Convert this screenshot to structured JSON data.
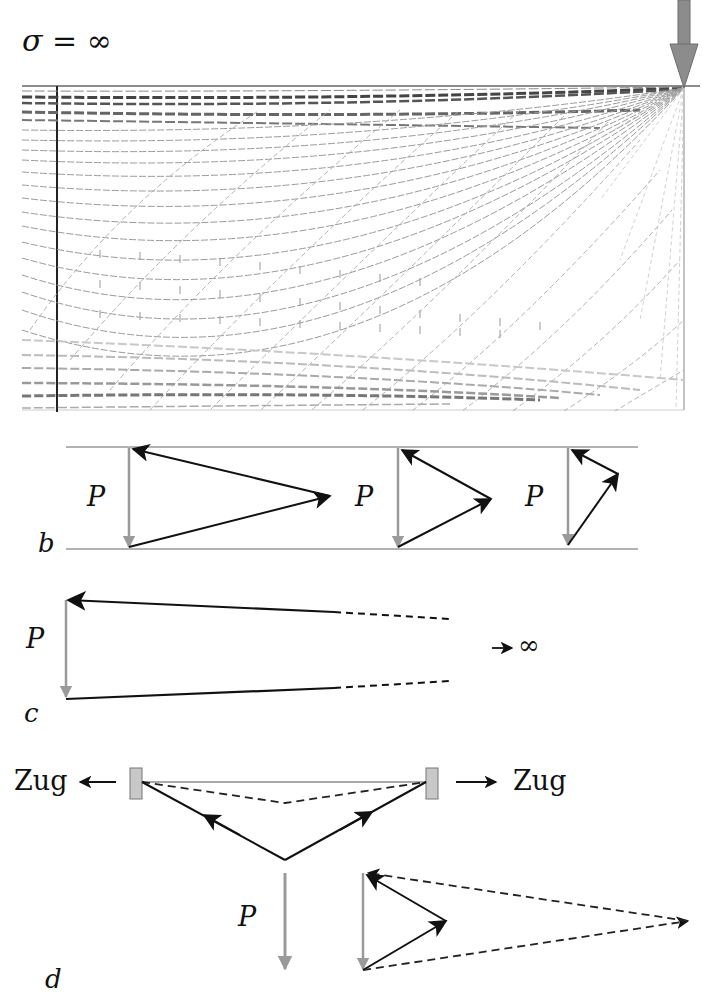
{
  "panel_a": {
    "title": "σ = ∞",
    "description": "Stress trajectory field (principal stress lines) in a rectangular deep beam with point load at top-right corner"
  },
  "panel_b": {
    "label": "b",
    "force_label": "P",
    "polygons": [
      {
        "force_label": "P"
      },
      {
        "force_label": "P"
      },
      {
        "force_label": "P"
      }
    ]
  },
  "panel_c": {
    "label": "c",
    "force_label": "P",
    "limit_text": "→ ∞"
  },
  "panel_d": {
    "label": "d",
    "force_label": "P",
    "left_tension": "Zug",
    "right_tension": "Zug"
  },
  "colors": {
    "load_arrow": "#8c8c8c",
    "force_P": "#9a9a9a",
    "strut": "#111111",
    "boundary": "#555555",
    "support": "#c8c8c8"
  }
}
